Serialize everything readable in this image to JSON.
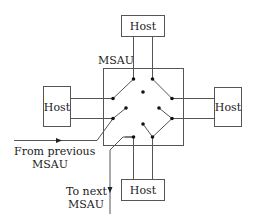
{
  "diagram": {
    "title_label": "MSAU",
    "hosts": {
      "top": "Host",
      "left": "Host",
      "right": "Host",
      "bottom": "Host"
    },
    "annotations": {
      "from_line1": "From previous",
      "from_line2": "MSAU",
      "to_line1": "To next",
      "to_line2": "MSAU"
    },
    "colors": {
      "stroke": "#555555",
      "dot": "#111111",
      "text": "#222222",
      "background": "#ffffff"
    }
  }
}
